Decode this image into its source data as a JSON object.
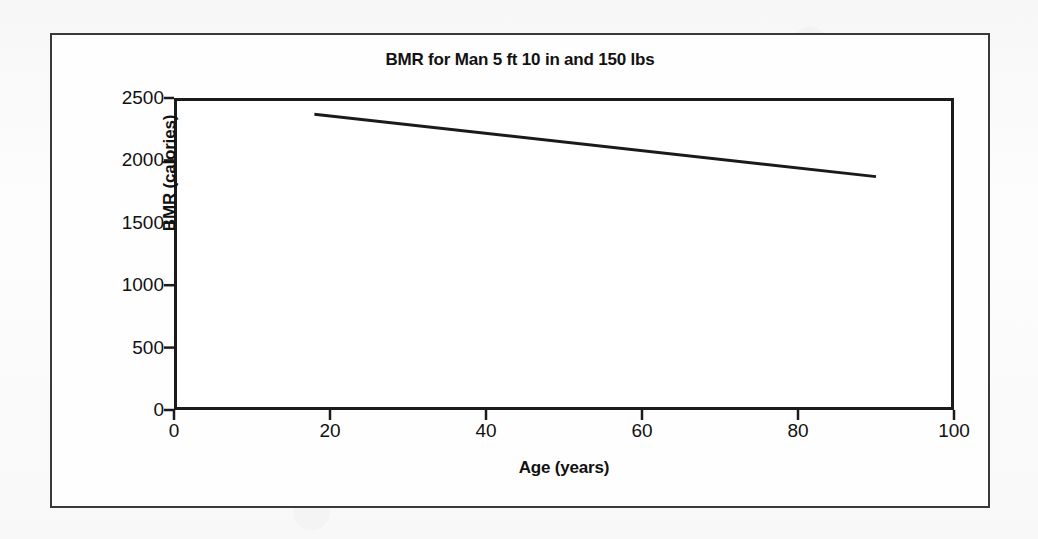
{
  "figure": {
    "title": "BMR for Man 5 ft 10 in and 150 lbs",
    "border_color": "#3a3a3c",
    "plot_border_color": "#1b1b1b",
    "line_color": "#1a1a1a",
    "background": "#ffffff"
  },
  "chart_data": {
    "type": "line",
    "title": "BMR for Man 5 ft 10 in and 150 lbs",
    "xlabel": "Age (years)",
    "ylabel": "BMR (calories)",
    "xlim": [
      0,
      100
    ],
    "ylim": [
      0,
      2500
    ],
    "xticks": [
      0,
      20,
      40,
      60,
      80,
      100
    ],
    "yticks": [
      0,
      500,
      1000,
      1500,
      2000,
      2500
    ],
    "xtick_labels": [
      "0",
      "20",
      "40",
      "60",
      "80",
      "100"
    ],
    "ytick_labels": [
      "0",
      "500",
      "1000",
      "1500",
      "2000",
      "2500"
    ],
    "grid": false,
    "legend": false,
    "series": [
      {
        "name": "BMR",
        "x": [
          18,
          90
        ],
        "values": [
          2370,
          1870
        ],
        "line_width": 3,
        "color": "#1a1a1a"
      }
    ],
    "annotations": []
  }
}
